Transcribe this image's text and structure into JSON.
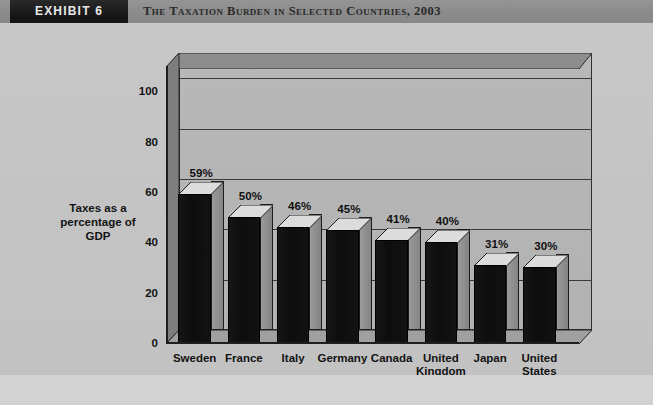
{
  "header": {
    "exhibit_label": "EXHIBIT 6",
    "title": "The Taxation Burden in Selected Countries, 2003"
  },
  "chart_data": {
    "type": "bar",
    "title": "The Taxation Burden in Selected Countries, 2003",
    "categories": [
      "Sweden",
      "France",
      "Italy",
      "Germany",
      "Canada",
      "United Kingdom",
      "Japan",
      "United States"
    ],
    "values": [
      59,
      50,
      46,
      45,
      41,
      40,
      31,
      30
    ],
    "data_labels": [
      "59%",
      "50%",
      "46%",
      "45%",
      "41%",
      "40%",
      "31%",
      "30%"
    ],
    "xlabel": "Country",
    "ylabel": "Taxes as a percentage of GDP",
    "ylim": [
      0,
      110
    ],
    "yticks": [
      0,
      20,
      40,
      60,
      80,
      100
    ],
    "ytick_labels": [
      "0",
      "20",
      "40",
      "60",
      "80",
      "100"
    ],
    "grid": true,
    "legend": false,
    "style_3d": true,
    "colors": {
      "bar_front": "#101010",
      "bar_side": "#8e8e8e",
      "bar_top": "#d8d8d8",
      "plot_background": "#b4b4b4",
      "figure_background": "#c6c6c6",
      "header_band": "#8e8e8e",
      "exhibit_badge": "#1c1c1c",
      "axis": "#1e1e1e"
    }
  }
}
